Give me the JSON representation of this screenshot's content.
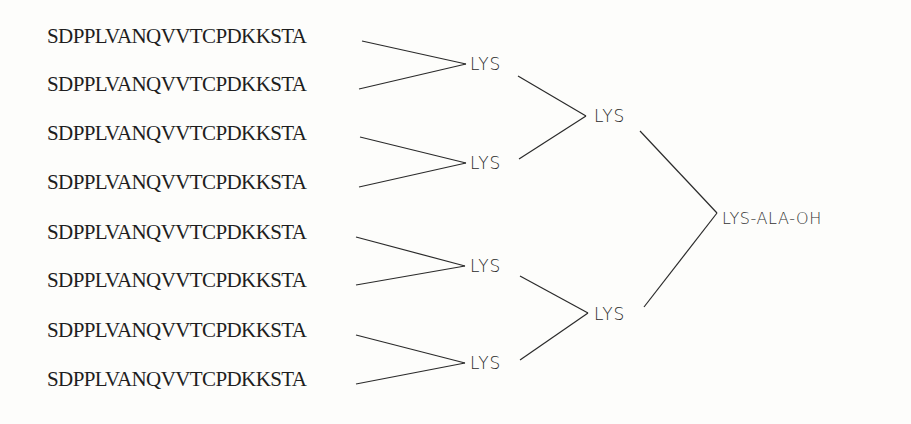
{
  "diagram": {
    "type": "branched-peptide-dendrimer",
    "peptides": [
      {
        "label": "SDPPLVANQVVTCPDKKSTA"
      },
      {
        "label": "SDPPLVANQVVTCPDKKSTA"
      },
      {
        "label": "SDPPLVANQVVTCPDKKSTA"
      },
      {
        "label": "SDPPLVANQVVTCPDKKSTA"
      },
      {
        "label": "SDPPLVANQVVTCPDKKSTA"
      },
      {
        "label": "SDPPLVANQVVTCPDKKSTA"
      },
      {
        "label": "SDPPLVANQVVTCPDKKSTA"
      },
      {
        "label": "SDPPLVANQVVTCPDKKSTA"
      }
    ],
    "level1_nodes": [
      {
        "label": "LYS"
      },
      {
        "label": "LYS"
      },
      {
        "label": "LYS"
      },
      {
        "label": "LYS"
      }
    ],
    "level2_nodes": [
      {
        "label": "LYS"
      },
      {
        "label": "LYS"
      }
    ],
    "root": {
      "label": "LYS-ALA-OH"
    },
    "edges": [
      [
        "peptide-1",
        "lys-1a"
      ],
      [
        "peptide-2",
        "lys-1a"
      ],
      [
        "peptide-3",
        "lys-1b"
      ],
      [
        "peptide-4",
        "lys-1b"
      ],
      [
        "peptide-5",
        "lys-1c"
      ],
      [
        "peptide-6",
        "lys-1c"
      ],
      [
        "peptide-7",
        "lys-1d"
      ],
      [
        "peptide-8",
        "lys-1d"
      ],
      [
        "lys-1a",
        "lys-2a"
      ],
      [
        "lys-1b",
        "lys-2a"
      ],
      [
        "lys-1c",
        "lys-2b"
      ],
      [
        "lys-1d",
        "lys-2b"
      ],
      [
        "lys-2a",
        "root"
      ],
      [
        "lys-2b",
        "root"
      ]
    ]
  }
}
